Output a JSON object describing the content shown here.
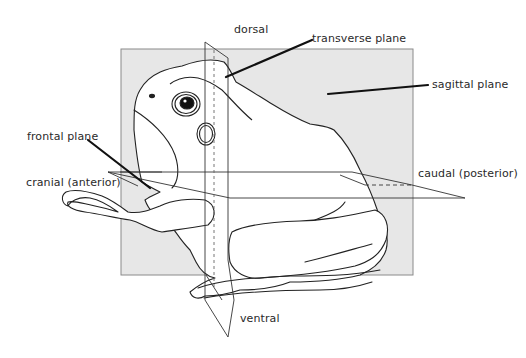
{
  "figure": {
    "background_color": "#ffffff",
    "sagittal_panel_color": "#e7e7e7",
    "line_color": "#222222",
    "labels": {
      "dorsal": "dorsal",
      "transverse_plane": "transverse plane",
      "sagittal_plane": "sagittal plane",
      "frontal_plane": "frontal plane",
      "cranial": "cranial (anterior)",
      "caudal": "caudal (posterior)",
      "ventral": "ventral"
    }
  }
}
